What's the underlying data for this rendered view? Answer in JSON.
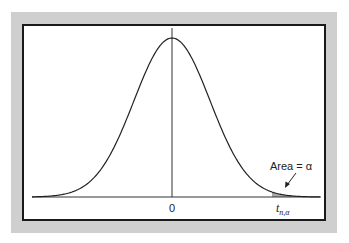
{
  "figure": {
    "labels": {
      "center_tick": "0",
      "critical_value": "t",
      "critical_value_subscript": "n,α",
      "area_label": "Area = α"
    },
    "colors": {
      "panel": "#cfcfcf",
      "frame_border": "#1a1a1a",
      "curve": "#222222",
      "shade": "#a8a8a8"
    }
  }
}
